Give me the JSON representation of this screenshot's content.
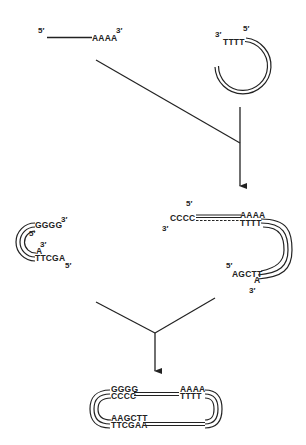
{
  "colors": {
    "ink": "#222222",
    "background": "#ffffff"
  },
  "mrna": {
    "five_prime": "5′",
    "poly_a": "AAAA",
    "three_prime": "3′"
  },
  "vector_primer": {
    "three_prime": "3′",
    "oligo_t": "TTTT",
    "five_prime": "5′"
  },
  "linker_hairpin": {
    "gggg": "GGGG",
    "gggg_three_prime": "3′",
    "inner_five_prime": "5′",
    "inner_three_prime": "3′",
    "a": "A",
    "ttcga": "TTCGA",
    "ttcga_five_prime": "5′"
  },
  "intermediate": {
    "top_five_prime": "5′",
    "cccc": "CCCC",
    "left_three_prime": "3′",
    "aaaa": "AAAA",
    "tttt": "TTTT",
    "lower_five_prime": "5′",
    "agctt": "AGCTT",
    "a": "A",
    "lower_three_prime": "3′"
  },
  "final_product": {
    "gggg": "GGGG",
    "cccc": "CCCC",
    "aaaa": "AAAA",
    "tttt": "TTTT",
    "aagctt": "AAGCTT",
    "ttcgaa": "TTCGAA"
  }
}
